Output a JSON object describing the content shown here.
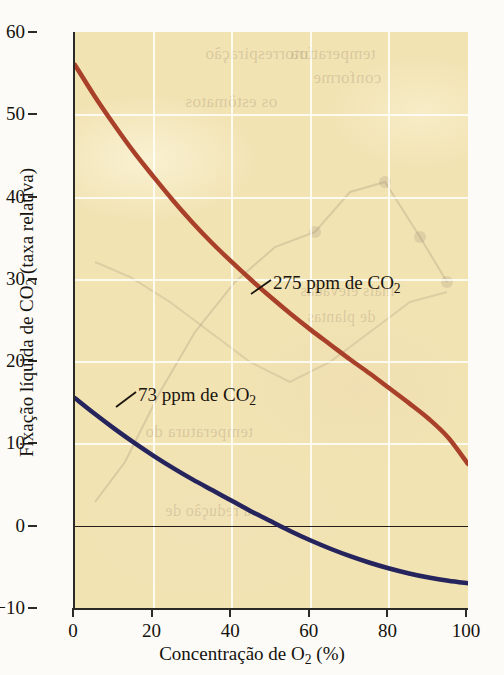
{
  "chart_data": {
    "type": "line",
    "title": "",
    "xlabel": "Concentração de O₂ (%)",
    "ylabel": "Fixação líquida de CO₂ (taxa relativa)",
    "xlabel_parts": {
      "pre": "Concentração de O",
      "sub": "2",
      "post": " (%)"
    },
    "ylabel_parts": {
      "pre": "Fixação líquida de CO",
      "sub": "2",
      "post": " (taxa relativa)"
    },
    "xlim": [
      0,
      100
    ],
    "ylim": [
      -10,
      60
    ],
    "xticks": [
      0,
      20,
      40,
      60,
      80,
      100
    ],
    "yticks": [
      -10,
      0,
      10,
      20,
      30,
      40,
      50,
      60
    ],
    "xtick_labels": [
      "0",
      "20",
      "40",
      "60",
      "80",
      "100"
    ],
    "ytick_labels": [
      "−10",
      "0",
      "10",
      "20",
      "30",
      "40",
      "50",
      "60"
    ],
    "grid": true,
    "grid_color": "#ffffff",
    "zero_line": true,
    "zero_line_color": "#241f18",
    "plot_background": "#f2e3b3",
    "legend_position": "inline-annotations",
    "series": [
      {
        "name": "275 ppm de CO₂",
        "label_parts": {
          "pre": "275 ppm de CO",
          "sub": "2"
        },
        "color": "#a8402a",
        "x": [
          0,
          5,
          10,
          15,
          20,
          25,
          30,
          35,
          40,
          45,
          50,
          55,
          60,
          65,
          70,
          75,
          80,
          85,
          90,
          95,
          100
        ],
        "y": [
          56.0,
          52.2,
          48.7,
          45.4,
          42.4,
          39.5,
          36.8,
          34.3,
          32.0,
          29.8,
          27.7,
          25.7,
          23.8,
          22.0,
          20.2,
          18.5,
          16.7,
          14.9,
          13.0,
          10.7,
          7.5
        ]
      },
      {
        "name": "73 ppm de CO₂",
        "label_parts": {
          "pre": "73 ppm de CO",
          "sub": "2"
        },
        "color": "#26245c",
        "x": [
          0,
          5,
          10,
          15,
          20,
          25,
          30,
          35,
          40,
          45,
          50,
          55,
          60,
          65,
          70,
          75,
          80,
          85,
          90,
          95,
          100
        ],
        "y": [
          15.5,
          13.6,
          11.8,
          10.1,
          8.5,
          7.0,
          5.6,
          4.3,
          3.0,
          1.7,
          0.5,
          -0.7,
          -1.8,
          -2.8,
          -3.7,
          -4.5,
          -5.2,
          -5.8,
          -6.3,
          -6.7,
          -7.0
        ]
      }
    ],
    "annotations": [
      {
        "name": "275 ppm de CO₂",
        "x_pct": 47,
        "y_val": 27
      },
      {
        "name": "73 ppm de CO₂",
        "x_pct": 12,
        "y_val": 13
      }
    ]
  },
  "ghost_text": {
    "lines": [
      "temperatura",
      "conforme",
      "fotorrespiração",
      "os estômatos",
      "mais elevadas",
      "de plantas",
      "temperatura do",
      "a redução de"
    ]
  }
}
